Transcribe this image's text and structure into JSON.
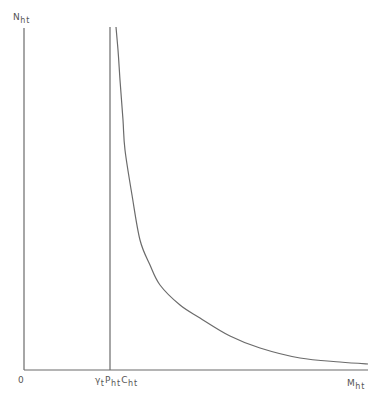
{
  "diagram": {
    "type": "economic-curve",
    "axes": {
      "y_label": "N",
      "y_label_sub": "ht",
      "x_label": "M",
      "x_label_sub": "ht",
      "origin_label": "0"
    },
    "vertical_line_label": {
      "gamma": "γ",
      "gamma_sub": "t",
      "p": "P",
      "p_sub": "ht",
      "c": "C",
      "c_sub": "ht"
    },
    "colors": {
      "line": "#6b6b6b",
      "text": "#555555",
      "background": "#ffffff"
    },
    "curve_points": [
      [
        116,
        27
      ],
      [
        118,
        50
      ],
      [
        120,
        80
      ],
      [
        123,
        120
      ],
      [
        125,
        150
      ],
      [
        132,
        195
      ],
      [
        140,
        240
      ],
      [
        150,
        265
      ],
      [
        160,
        285
      ],
      [
        180,
        305
      ],
      [
        200,
        318
      ],
      [
        230,
        336
      ],
      [
        260,
        348
      ],
      [
        300,
        358
      ],
      [
        340,
        362
      ],
      [
        368,
        364
      ]
    ]
  }
}
